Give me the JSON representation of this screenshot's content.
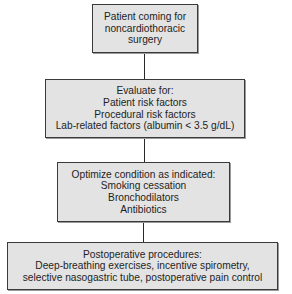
{
  "flowchart": {
    "nodes": [
      {
        "id": "start",
        "lines": [
          "Patient coming for",
          "noncardiothoracic",
          "surgery"
        ]
      },
      {
        "id": "evaluate",
        "lines": [
          "Evaluate for:",
          "Patient risk factors",
          "Procedural risk factors",
          "Lab-related factors (albumin < 3.5 g/dL)"
        ]
      },
      {
        "id": "optimize",
        "lines": [
          "Optimize condition as indicated:",
          "Smoking cessation",
          "Bronchodilators",
          "Antibiotics"
        ]
      },
      {
        "id": "postop",
        "lines": [
          "Postoperative procedures:",
          "Deep-breathing exercises, incentive spirometry,",
          "selective nasogastric tube, postoperative pain control"
        ]
      }
    ],
    "edges": [
      {
        "from": "start",
        "to": "evaluate"
      },
      {
        "from": "evaluate",
        "to": "optimize"
      },
      {
        "from": "optimize",
        "to": "postop"
      }
    ],
    "colors": {
      "box_fill": "#e3e3e3",
      "box_border": "#3a3a3a",
      "line": "#2a2a2a"
    }
  }
}
